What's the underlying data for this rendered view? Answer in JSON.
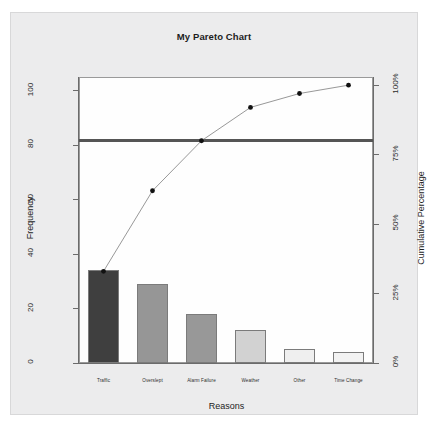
{
  "chart_data": {
    "type": "bar",
    "title": "My Pareto Chart",
    "xlabel": "Reasons",
    "ylabel": "Frequency",
    "y2label": "Cumulative Percentage",
    "categories": [
      "Traffic",
      "Overslept",
      "Alarm Failure",
      "Weather",
      "Other",
      "Time Change"
    ],
    "values": [
      34,
      29,
      18,
      12,
      5,
      4
    ],
    "cumulative_percent": [
      33,
      62,
      80,
      92,
      97,
      100
    ],
    "series": [
      {
        "name": "Frequency",
        "type": "bar",
        "values": [
          34,
          29,
          18,
          12,
          5,
          4
        ]
      },
      {
        "name": "Cumulative Percentage",
        "type": "line",
        "values": [
          33,
          62,
          80,
          92,
          97,
          100
        ]
      }
    ],
    "ylim": [
      0,
      105
    ],
    "y2lim": [
      0,
      100
    ],
    "yticks": [
      0,
      20,
      40,
      60,
      80,
      100
    ],
    "ytick_labels": [
      "0",
      "20",
      "40",
      "60",
      "80",
      "100"
    ],
    "y2ticks": [
      0,
      25,
      50,
      75,
      100
    ],
    "y2tick_labels": [
      "0%",
      "25%",
      "50%",
      "75%",
      "100%"
    ],
    "threshold_line": {
      "value": 80,
      "unit": "percent",
      "color": "#555555"
    },
    "grid": false,
    "legend": "none",
    "bar_colors": [
      "#3f3f3f",
      "#969696",
      "#989898",
      "#d2d2d2",
      "#efefef",
      "#f2f2f2"
    ],
    "bar_border_color": "#7b7b7b",
    "line_color": "#8c8c8c",
    "point_color": "#111111",
    "background": "#ececed",
    "plot_background": "#fefefe"
  }
}
